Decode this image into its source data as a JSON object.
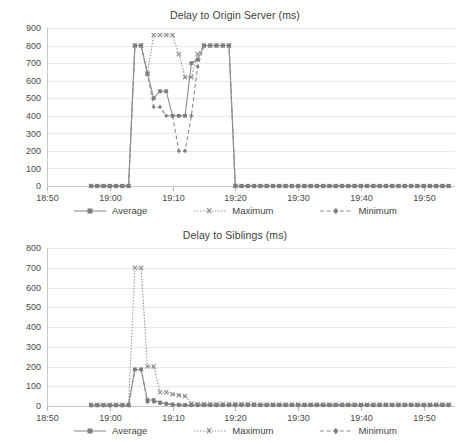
{
  "page": {
    "background": "#ffffff",
    "line_color": "#8c8c8c",
    "grid_color": "#e9e9e9",
    "axis_color": "#c8c8c8",
    "text_color": "#3a3a3a"
  },
  "legend": {
    "items": [
      {
        "label": "Average",
        "key": "average",
        "style": "solid",
        "marker": "square-small",
        "icon": "legend-line-solid-icon"
      },
      {
        "label": "Maximum",
        "key": "maximum",
        "style": "dotted",
        "marker": "cross",
        "icon": "legend-line-dotted-icon"
      },
      {
        "label": "Minimum",
        "key": "minimum",
        "style": "dashed",
        "marker": "diamond",
        "icon": "legend-line-dashed-icon"
      }
    ]
  },
  "chart_data": [
    {
      "id": "origin",
      "type": "line",
      "title": "Delay to Origin Server (ms)",
      "xlabel": "",
      "ylabel": "",
      "ylim": [
        0,
        900
      ],
      "ytick_step": 100,
      "yticks": [
        0,
        100,
        200,
        300,
        400,
        500,
        600,
        700,
        800,
        900
      ],
      "grid": true,
      "legend_position": "bottom",
      "xlim_minutes": [
        1130,
        1195
      ],
      "xticks": [
        "18:50",
        "19:00",
        "19:10",
        "19:20",
        "19:30",
        "19:40",
        "19:50"
      ],
      "xtick_minutes": [
        1130,
        1140,
        1150,
        1160,
        1170,
        1180,
        1190
      ],
      "x": [
        1137,
        1138,
        1139,
        1140,
        1141,
        1142,
        1143,
        1144,
        1145,
        1146,
        1147,
        1148,
        1149,
        1150,
        1151,
        1152,
        1153,
        1154,
        1155,
        1156,
        1157,
        1158,
        1159,
        1160,
        1161,
        1162,
        1163,
        1164,
        1165,
        1166,
        1167,
        1168,
        1169,
        1170,
        1171,
        1172,
        1173,
        1174,
        1175,
        1176,
        1177,
        1178,
        1179,
        1180,
        1181,
        1182,
        1183,
        1184,
        1185,
        1186,
        1187,
        1188,
        1189,
        1190,
        1191,
        1192,
        1193,
        1194
      ],
      "series": [
        {
          "name": "Average",
          "key": "average",
          "values": [
            0,
            0,
            0,
            0,
            0,
            0,
            0,
            800,
            800,
            640,
            500,
            540,
            540,
            400,
            400,
            400,
            700,
            720,
            800,
            800,
            800,
            800,
            800,
            0,
            0,
            0,
            0,
            0,
            0,
            0,
            0,
            0,
            0,
            0,
            0,
            0,
            0,
            0,
            0,
            0,
            0,
            0,
            0,
            0,
            0,
            0,
            0,
            0,
            0,
            0,
            0,
            0,
            0,
            0,
            0,
            0,
            0,
            0
          ]
        },
        {
          "name": "Maximum",
          "key": "maximum",
          "values": [
            0,
            0,
            0,
            0,
            0,
            0,
            0,
            800,
            800,
            640,
            860,
            860,
            860,
            860,
            750,
            620,
            620,
            750,
            800,
            800,
            800,
            800,
            800,
            0,
            0,
            0,
            0,
            0,
            0,
            0,
            0,
            0,
            0,
            0,
            0,
            0,
            0,
            0,
            0,
            0,
            0,
            0,
            0,
            0,
            0,
            0,
            0,
            0,
            0,
            0,
            0,
            0,
            0,
            0,
            0,
            0,
            0,
            0
          ]
        },
        {
          "name": "Minimum",
          "key": "minimum",
          "values": [
            0,
            0,
            0,
            0,
            0,
            0,
            0,
            800,
            800,
            640,
            450,
            450,
            400,
            400,
            200,
            200,
            400,
            680,
            800,
            800,
            800,
            800,
            800,
            0,
            0,
            0,
            0,
            0,
            0,
            0,
            0,
            0,
            0,
            0,
            0,
            0,
            0,
            0,
            0,
            0,
            0,
            0,
            0,
            0,
            0,
            0,
            0,
            0,
            0,
            0,
            0,
            0,
            0,
            0,
            0,
            0,
            0,
            0
          ]
        }
      ]
    },
    {
      "id": "siblings",
      "type": "line",
      "title": "Delay to Siblings (ms)",
      "xlabel": "",
      "ylabel": "",
      "ylim": [
        0,
        800
      ],
      "ytick_step": 100,
      "yticks": [
        0,
        100,
        200,
        300,
        400,
        500,
        600,
        700,
        800
      ],
      "grid": true,
      "legend_position": "bottom",
      "xlim_minutes": [
        1130,
        1195
      ],
      "xticks": [
        "18:50",
        "19:00",
        "19:10",
        "19:20",
        "19:30",
        "19:40",
        "19:50"
      ],
      "xtick_minutes": [
        1130,
        1140,
        1150,
        1160,
        1170,
        1180,
        1190
      ],
      "x": [
        1137,
        1138,
        1139,
        1140,
        1141,
        1142,
        1143,
        1144,
        1145,
        1146,
        1147,
        1148,
        1149,
        1150,
        1151,
        1152,
        1153,
        1154,
        1155,
        1156,
        1157,
        1158,
        1159,
        1160,
        1161,
        1162,
        1163,
        1164,
        1165,
        1166,
        1167,
        1168,
        1169,
        1170,
        1171,
        1172,
        1173,
        1174,
        1175,
        1176,
        1177,
        1178,
        1179,
        1180,
        1181,
        1182,
        1183,
        1184,
        1185,
        1186,
        1187,
        1188,
        1189,
        1190,
        1191,
        1192,
        1193,
        1194
      ],
      "series": [
        {
          "name": "Average",
          "key": "average",
          "values": [
            4,
            4,
            4,
            4,
            4,
            4,
            4,
            185,
            185,
            30,
            30,
            18,
            12,
            8,
            6,
            5,
            5,
            5,
            5,
            5,
            5,
            5,
            5,
            6,
            6,
            6,
            6,
            5,
            5,
            5,
            5,
            5,
            5,
            5,
            5,
            5,
            5,
            5,
            5,
            5,
            5,
            5,
            5,
            5,
            5,
            5,
            5,
            5,
            5,
            5,
            5,
            5,
            5,
            5,
            5,
            5,
            5,
            5
          ]
        },
        {
          "name": "Maximum",
          "key": "maximum",
          "values": [
            6,
            6,
            6,
            6,
            6,
            6,
            6,
            700,
            700,
            200,
            200,
            70,
            70,
            60,
            55,
            50,
            12,
            10,
            10,
            10,
            10,
            10,
            10,
            10,
            10,
            10,
            10,
            8,
            8,
            8,
            8,
            8,
            8,
            8,
            8,
            8,
            8,
            8,
            8,
            8,
            8,
            8,
            8,
            8,
            8,
            8,
            8,
            8,
            8,
            8,
            8,
            8,
            8,
            8,
            8,
            8,
            8,
            8
          ]
        },
        {
          "name": "Minimum",
          "key": "minimum",
          "values": [
            3,
            3,
            3,
            3,
            3,
            3,
            3,
            185,
            185,
            20,
            20,
            14,
            10,
            6,
            5,
            4,
            4,
            4,
            4,
            4,
            4,
            4,
            4,
            4,
            4,
            4,
            4,
            4,
            4,
            4,
            4,
            4,
            4,
            4,
            4,
            4,
            4,
            4,
            4,
            4,
            4,
            4,
            4,
            4,
            4,
            4,
            4,
            4,
            4,
            4,
            4,
            4,
            4,
            4,
            4,
            4,
            4,
            4
          ]
        }
      ]
    }
  ]
}
